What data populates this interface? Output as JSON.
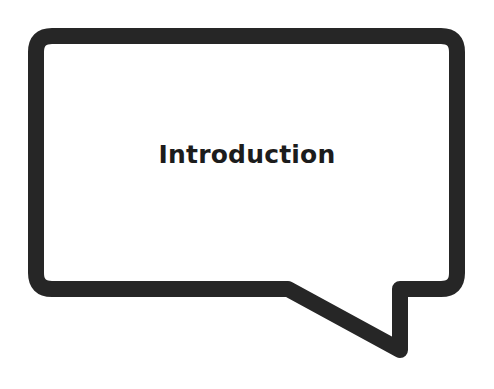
{
  "bubble": {
    "label": "Introduction",
    "stroke_color": "#262626",
    "fill_color": "#ffffff"
  }
}
